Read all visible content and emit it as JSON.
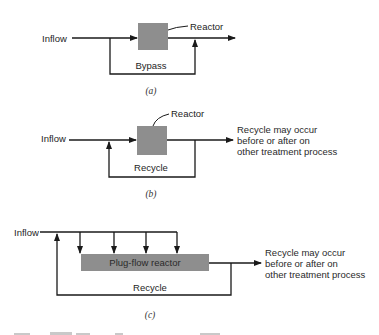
{
  "figure": {
    "panel_a": {
      "inflow_label": "Inflow",
      "reactor_label": "Reactor",
      "loop_label": "Bypass",
      "caption": "(a)"
    },
    "panel_b": {
      "inflow_label": "Inflow",
      "reactor_label": "Reactor",
      "loop_label": "Recycle",
      "note_lines": [
        "Recycle may occur",
        "before or after on",
        "other treatment process"
      ],
      "caption": "(b)"
    },
    "panel_c": {
      "inflow_label": "Inflow",
      "reactor_label": "Plug-flow reactor",
      "loop_label": "Recycle",
      "note_lines": [
        "Recycle may occur",
        "before or after on",
        "other treatment process"
      ],
      "caption": "(c)"
    },
    "colors": {
      "reactor_fill": "#8e8e8e",
      "line": "#1a1a1a"
    }
  }
}
